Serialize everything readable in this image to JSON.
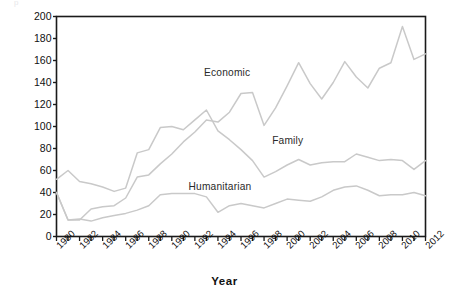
{
  "figure": {
    "ghost_title_fragment": "p",
    "background_color": "#ffffff",
    "frame_color": "#1a1a1a",
    "line_color": "#c9c9c9",
    "text_color": "#111111"
  },
  "axes": {
    "ylabel": "Number of immigrants in thousands",
    "xlabel": "Year",
    "yticks": [
      "0",
      "20",
      "40",
      "60",
      "80",
      "100",
      "120",
      "140",
      "160",
      "180",
      "200"
    ],
    "xticks": [
      "1980",
      "1982",
      "1984",
      "1986",
      "1988",
      "1990",
      "1992",
      "1994",
      "1996",
      "1998",
      "2000",
      "2002",
      "2004",
      "2006",
      "2008",
      "2010",
      "2012"
    ]
  },
  "series_labels": {
    "economic": "Economic",
    "family": "Family",
    "humanitarian": "Humanitarian"
  },
  "chart_data": {
    "type": "line",
    "title": "",
    "xlabel": "Year",
    "ylabel": "Number of immigrants in thousands",
    "xlim": [
      1980,
      2012
    ],
    "ylim": [
      0,
      200
    ],
    "ytick_step": 20,
    "xtick_step": 2,
    "grid": false,
    "legend": "inline-labels",
    "x": [
      1980,
      1981,
      1982,
      1983,
      1984,
      1985,
      1986,
      1987,
      1988,
      1989,
      1990,
      1991,
      1992,
      1993,
      1994,
      1995,
      1996,
      1997,
      1998,
      1999,
      2000,
      2001,
      2002,
      2003,
      2004,
      2005,
      2006,
      2007,
      2008,
      2009,
      2010,
      2011,
      2012
    ],
    "series": [
      {
        "name": "Economic",
        "color": "#c9c9c9",
        "values": [
          40,
          15,
          15,
          25,
          27,
          28,
          35,
          54,
          56,
          66,
          75,
          86,
          95,
          106,
          104,
          113,
          130,
          131,
          101,
          117,
          137,
          158,
          139,
          125,
          140,
          159,
          145,
          135,
          153,
          158,
          191,
          161,
          166
        ]
      },
      {
        "name": "Family",
        "color": "#c9c9c9",
        "values": [
          52,
          60,
          50,
          48,
          45,
          41,
          44,
          76,
          79,
          99,
          100,
          97,
          106,
          115,
          96,
          88,
          79,
          69,
          54,
          59,
          65,
          70,
          65,
          67,
          68,
          68,
          75,
          72,
          69,
          70,
          69,
          61,
          69
        ]
      },
      {
        "name": "Humanitarian",
        "color": "#c9c9c9",
        "values": [
          40,
          15,
          16,
          14,
          17,
          19,
          21,
          24,
          28,
          38,
          39,
          39,
          39,
          36,
          22,
          28,
          30,
          28,
          26,
          30,
          34,
          33,
          32,
          36,
          42,
          45,
          46,
          42,
          37,
          38,
          38,
          40,
          37
        ]
      }
    ]
  }
}
